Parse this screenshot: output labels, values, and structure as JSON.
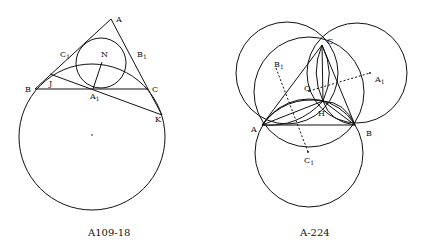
{
  "figures": [
    {
      "caption": "A109-18",
      "labels": {
        "A": "A",
        "B": "B",
        "C": "C",
        "C1": "C",
        "C1_sub": "1",
        "B1": "B",
        "B1_sub": "1",
        "A1": "A",
        "A1_sub": "1",
        "N": "N",
        "J": "J",
        "K": "K"
      }
    },
    {
      "caption": "A-224",
      "labels": {
        "A": "A",
        "B": "B",
        "C": "C",
        "O": "O",
        "H": "H",
        "A1": "A",
        "A1_sub": "1",
        "B1": "B",
        "B1_sub": "1",
        "C1": "C",
        "C1_sub": "1"
      }
    }
  ]
}
